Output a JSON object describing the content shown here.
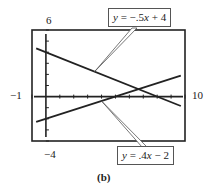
{
  "chart_data": {
    "type": "line",
    "title": "",
    "caption": "(b)",
    "xlabel": "",
    "ylabel": "",
    "xlim": [
      -1,
      10
    ],
    "ylim": [
      -4,
      6
    ],
    "xscale": 1,
    "yscale": 1,
    "grid": false,
    "window_labels": {
      "ymax": "6",
      "ymin": "-4",
      "xmin": "-1",
      "xmax": "10"
    },
    "series": [
      {
        "name": "y = -.5x + 4",
        "equation": "y = -.5x + 4",
        "slope": -0.5,
        "intercept": 4,
        "x": [
          -1,
          10
        ],
        "y": [
          4.5,
          -1
        ]
      },
      {
        "name": "y = .4x - 2",
        "equation": "y = .4x - 2",
        "slope": 0.4,
        "intercept": -2,
        "x": [
          -1,
          10
        ],
        "y": [
          -2.4,
          2
        ]
      }
    ],
    "annotations": [
      {
        "text": "y = −.5x + 4",
        "points_to_series": 0
      },
      {
        "text": "y = .4x − 2",
        "points_to_series": 1
      }
    ]
  },
  "labels": {
    "ymax": "6",
    "ymin": "−4",
    "xmin": "−1",
    "xmax": "10",
    "caption": "(b)"
  },
  "callouts": {
    "top": {
      "y": "y",
      "eq": " = −.5",
      "x": "x",
      "rest": " + 4"
    },
    "bottom": {
      "y": "y",
      "eq": " = .4",
      "x": "x",
      "rest": " − 2"
    }
  }
}
